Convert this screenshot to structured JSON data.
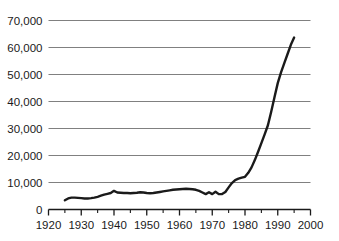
{
  "chart_data": {
    "type": "line",
    "title": "",
    "subtitle": "",
    "xlabel": "",
    "ylabel": "",
    "xlim": [
      1920,
      2000
    ],
    "ylim": [
      0,
      70000
    ],
    "grid": "horizontal",
    "legend": "none",
    "colors": {
      "line": "#1a1a1a",
      "grid": "#808080",
      "axis": "#1a1a1a",
      "text": "#1a1a1a",
      "background": "#ffffff"
    },
    "y_ticks": [
      0,
      10000,
      20000,
      30000,
      40000,
      50000,
      60000,
      70000
    ],
    "y_tick_labels": [
      "0",
      "10,000",
      "20,000",
      "30,000",
      "40,000",
      "50,000",
      "60,000",
      "70,000"
    ],
    "x_ticks": [
      1920,
      1930,
      1940,
      1950,
      1960,
      1970,
      1980,
      1990,
      2000
    ],
    "x_tick_labels": [
      "1920",
      "1930",
      "1940",
      "1950",
      "1960",
      "1970",
      "1980",
      "1990",
      "2000"
    ],
    "x_minor_ticks": [
      1925,
      1935,
      1945,
      1955,
      1965,
      1975,
      1985,
      1995
    ],
    "series": [
      {
        "name": "series-1",
        "color": "#1a1a1a",
        "x": [
          1925,
          1926,
          1927,
          1928,
          1929,
          1930,
          1931,
          1932,
          1933,
          1934,
          1935,
          1936,
          1937,
          1938,
          1939,
          1940,
          1941,
          1942,
          1943,
          1944,
          1945,
          1946,
          1947,
          1948,
          1949,
          1950,
          1951,
          1952,
          1953,
          1954,
          1955,
          1956,
          1957,
          1958,
          1959,
          1960,
          1961,
          1962,
          1963,
          1964,
          1965,
          1966,
          1967,
          1968,
          1969,
          1970,
          1971,
          1972,
          1973,
          1974,
          1975,
          1976,
          1977,
          1978,
          1979,
          1980,
          1981,
          1982,
          1983,
          1984,
          1985,
          1986,
          1987,
          1988,
          1989,
          1990,
          1991,
          1992,
          1993,
          1994,
          1995
        ],
        "values": [
          3400,
          4100,
          4400,
          4400,
          4300,
          4200,
          4100,
          4100,
          4200,
          4400,
          4700,
          5100,
          5500,
          5800,
          6100,
          6900,
          6300,
          6200,
          6100,
          6100,
          6000,
          6100,
          6200,
          6400,
          6300,
          6100,
          6000,
          6100,
          6300,
          6500,
          6700,
          6900,
          7100,
          7300,
          7400,
          7500,
          7600,
          7700,
          7600,
          7500,
          7300,
          6900,
          6300,
          5700,
          6400,
          5700,
          6600,
          5700,
          5700,
          6500,
          8200,
          9800,
          10900,
          11400,
          11800,
          12100,
          13600,
          15600,
          18300,
          21400,
          24600,
          27800,
          31200,
          36200,
          41600,
          46800,
          50800,
          54200,
          57600,
          61000,
          63700
        ]
      }
    ]
  }
}
